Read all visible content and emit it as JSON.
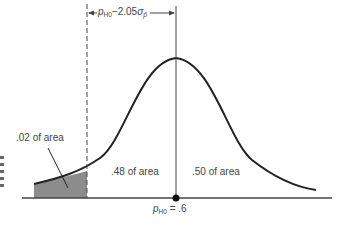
{
  "diagram": {
    "type": "normal-distribution-curve",
    "distance_label": {
      "var": "p",
      "sub": "H0",
      "rest": "−2.05",
      "sigma": "σ",
      "sigma_sub": "p̄"
    },
    "left_tail_label": ".02 of area",
    "middle_left_label": ".48 of area",
    "middle_right_label": ".50 of area",
    "mean_label": {
      "var": "p",
      "sub": "H0",
      "rest": " = .6"
    },
    "colors": {
      "curve": "#222222",
      "shaded": "#8c8c8c",
      "axis": "#444444"
    }
  }
}
